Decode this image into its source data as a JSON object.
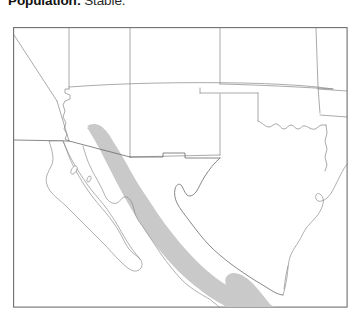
{
  "caption": {
    "label": "Population:",
    "value": "Stable."
  },
  "map": {
    "title": "Species range map of the southwestern United States and northern Mexico",
    "frame": {
      "x": 0,
      "y": 0,
      "width": 334,
      "height": 280,
      "border_color": "#6f6f6f",
      "background_color": "#ffffff"
    },
    "legend": {
      "range_shading_color": "#c9c9c9",
      "range_shading_label": "Range",
      "boundary_color": "#7b7b7b",
      "coastline_color": "#7b7b7b"
    },
    "range_regions": [
      {
        "name": "sierra-madre-occidental-range",
        "fill": "#c9c9c9",
        "points": "78,100 88,99 96,104 101,112 107,125 113,136 118,142 124,148 131,158 139,172 148,186 158,200 168,213 180,226 193,238 206,248 219,256 232,262 243,266 252,268 258,270 262,273 258,277 248,277 236,274 222,268 208,260 194,250 181,239 168,226 156,212 145,197 135,182 126,167 118,152 110,137 102,122 94,111 86,106 78,106"
      },
      {
        "name": "sierra-madre-oriental-range",
        "fill": "#c9c9c9",
        "points": "223,248 231,249 239,254 247,262 255,271 261,279 263,280 230,280 224,275 219,268 215,260 214,253 217,249"
      }
    ],
    "features": [
      "nevada",
      "utah",
      "colorado",
      "kansas",
      "california",
      "arizona",
      "new-mexico",
      "oklahoma",
      "texas",
      "baja-california-peninsula",
      "gulf-of-california",
      "mexico-mainland",
      "gulf-of-mexico",
      "rio-grande-border"
    ]
  }
}
